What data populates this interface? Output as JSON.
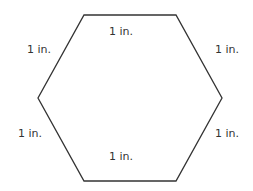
{
  "diagram": {
    "shape": "regular hexagon",
    "stroke_color": "#333333",
    "side_labels": {
      "top": "1 in.",
      "upper_left": "1 in.",
      "upper_right": "1 in.",
      "lower_left": "1 in.",
      "lower_right": "1 in.",
      "bottom": "1 in."
    }
  }
}
